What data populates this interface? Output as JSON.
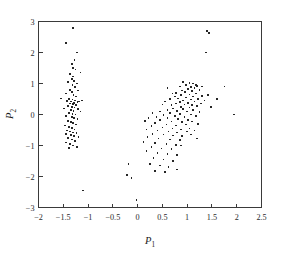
{
  "figure": {
    "background_color": "#ffffff",
    "axis_color": "#3a3a3a",
    "marker_color": "#262626"
  },
  "axes": {
    "x_label": "P",
    "x_label_sub": "1",
    "y_label": "P",
    "y_label_sub": "2"
  },
  "chart_data": {
    "type": "scatter",
    "title": "",
    "xlabel": "P₁",
    "ylabel": "P₂",
    "xlim": [
      -2,
      2.5
    ],
    "ylim": [
      -3,
      3
    ],
    "xticks": [
      -2,
      -1.5,
      -1,
      -0.5,
      0,
      0.5,
      1,
      1.5,
      2,
      2.5
    ],
    "xticklabels": [
      "−2",
      "−1.5",
      "−1",
      "−0.5",
      "0",
      "0.5",
      "1",
      "1.5",
      "2",
      "2.5"
    ],
    "yticks": [
      -3,
      -2,
      -1,
      0,
      1,
      2,
      3
    ],
    "yticklabels": [
      "−3",
      "−2",
      "−1",
      "0",
      "1",
      "2",
      "3"
    ],
    "grid": false,
    "legend": false,
    "marker": "square",
    "marker_size": 1.6,
    "series": [
      {
        "name": "left-cluster",
        "points": [
          [
            -1.3,
            2.8
          ],
          [
            -1.45,
            2.3
          ],
          [
            -1.22,
            2.0
          ],
          [
            -1.27,
            1.75
          ],
          [
            -1.33,
            1.62
          ],
          [
            -1.3,
            1.5
          ],
          [
            -1.25,
            1.45
          ],
          [
            -1.15,
            1.35
          ],
          [
            -1.36,
            1.3
          ],
          [
            -1.3,
            1.22
          ],
          [
            -1.33,
            1.15
          ],
          [
            -1.28,
            1.08
          ],
          [
            -1.4,
            1.05
          ],
          [
            -1.22,
            1.0
          ],
          [
            -1.31,
            0.95
          ],
          [
            -1.26,
            0.88
          ],
          [
            -1.37,
            0.8
          ],
          [
            -1.2,
            0.78
          ],
          [
            -1.33,
            0.72
          ],
          [
            -1.45,
            0.68
          ],
          [
            -1.29,
            0.62
          ],
          [
            -1.24,
            0.58
          ],
          [
            -1.55,
            0.52
          ],
          [
            -1.38,
            0.5
          ],
          [
            -1.31,
            0.48
          ],
          [
            -1.26,
            0.45
          ],
          [
            -1.43,
            0.44
          ],
          [
            -1.34,
            0.42
          ],
          [
            -1.21,
            0.4
          ],
          [
            -1.28,
            0.38
          ],
          [
            -1.18,
            0.42
          ],
          [
            -1.12,
            0.45
          ],
          [
            -1.36,
            0.35
          ],
          [
            -1.3,
            0.33
          ],
          [
            -1.24,
            0.3
          ],
          [
            -1.41,
            0.28
          ],
          [
            -1.33,
            0.25
          ],
          [
            -1.27,
            0.22
          ],
          [
            -1.48,
            0.2
          ],
          [
            -1.2,
            0.18
          ],
          [
            -1.35,
            0.15
          ],
          [
            -1.29,
            0.12
          ],
          [
            -1.15,
            0.1
          ],
          [
            -1.38,
            0.05
          ],
          [
            -1.31,
            0.02
          ],
          [
            -1.25,
            0.0
          ],
          [
            -1.44,
            -0.05
          ],
          [
            -1.33,
            -0.08
          ],
          [
            -1.28,
            -0.12
          ],
          [
            -1.21,
            -0.15
          ],
          [
            -1.4,
            -0.2
          ],
          [
            -1.35,
            -0.25
          ],
          [
            -1.3,
            -0.28
          ],
          [
            -1.24,
            -0.32
          ],
          [
            -1.47,
            -0.35
          ],
          [
            -1.38,
            -0.4
          ],
          [
            -1.32,
            -0.44
          ],
          [
            -1.27,
            -0.48
          ],
          [
            -1.42,
            -0.52
          ],
          [
            -1.36,
            -0.55
          ],
          [
            -1.3,
            -0.58
          ],
          [
            -1.23,
            -0.6
          ],
          [
            -1.45,
            -0.62
          ],
          [
            -1.34,
            -0.66
          ],
          [
            -1.28,
            -0.7
          ],
          [
            -1.19,
            -0.72
          ],
          [
            -1.4,
            -0.75
          ],
          [
            -1.33,
            -0.8
          ],
          [
            -1.26,
            -0.85
          ],
          [
            -1.44,
            -0.9
          ],
          [
            -1.36,
            -0.95
          ],
          [
            -1.3,
            -1.0
          ],
          [
            -1.22,
            -1.05
          ],
          [
            -1.39,
            -1.08
          ],
          [
            -1.1,
            -2.45
          ]
        ]
      },
      {
        "name": "right-cluster",
        "points": [
          [
            1.4,
            2.7
          ],
          [
            1.44,
            2.62
          ],
          [
            1.38,
            2.0
          ],
          [
            0.92,
            1.05
          ],
          [
            1.05,
            1.02
          ],
          [
            1.12,
            1.0
          ],
          [
            0.98,
            0.95
          ],
          [
            1.2,
            0.92
          ],
          [
            1.08,
            0.88
          ],
          [
            0.85,
            0.9
          ],
          [
            1.15,
            0.85
          ],
          [
            1.02,
            0.82
          ],
          [
            0.9,
            0.78
          ],
          [
            1.25,
            0.8
          ],
          [
            1.1,
            0.75
          ],
          [
            0.96,
            0.72
          ],
          [
            0.78,
            0.7
          ],
          [
            1.18,
            0.68
          ],
          [
            1.05,
            0.65
          ],
          [
            0.88,
            0.62
          ],
          [
            1.3,
            0.6
          ],
          [
            1.12,
            0.58
          ],
          [
            0.7,
            0.68
          ],
          [
            0.98,
            0.55
          ],
          [
            0.82,
            0.52
          ],
          [
            1.22,
            0.5
          ],
          [
            1.08,
            0.48
          ],
          [
            0.6,
            0.85
          ],
          [
            0.75,
            0.58
          ],
          [
            0.92,
            0.45
          ],
          [
            1.15,
            0.42
          ],
          [
            0.65,
            0.5
          ],
          [
            0.85,
            0.4
          ],
          [
            1.02,
            0.38
          ],
          [
            1.28,
            0.35
          ],
          [
            0.55,
            0.42
          ],
          [
            0.78,
            0.35
          ],
          [
            0.95,
            0.32
          ],
          [
            1.1,
            0.3
          ],
          [
            1.2,
            0.28
          ],
          [
            0.68,
            0.3
          ],
          [
            0.88,
            0.25
          ],
          [
            1.05,
            0.22
          ],
          [
            0.5,
            0.32
          ],
          [
            0.72,
            0.2
          ],
          [
            0.92,
            0.18
          ],
          [
            1.12,
            0.15
          ],
          [
            0.6,
            0.15
          ],
          [
            0.8,
            0.12
          ],
          [
            1.0,
            0.1
          ],
          [
            1.25,
            0.08
          ],
          [
            0.45,
            0.1
          ],
          [
            0.65,
            0.05
          ],
          [
            0.85,
            0.02
          ],
          [
            1.08,
            0.0
          ],
          [
            0.3,
            0.05
          ],
          [
            0.52,
            -0.02
          ],
          [
            0.75,
            -0.05
          ],
          [
            0.95,
            -0.08
          ],
          [
            1.18,
            -0.05
          ],
          [
            0.38,
            -0.08
          ],
          [
            0.6,
            -0.12
          ],
          [
            0.82,
            -0.15
          ],
          [
            1.02,
            -0.18
          ],
          [
            0.22,
            -0.12
          ],
          [
            0.45,
            -0.18
          ],
          [
            0.68,
            -0.22
          ],
          [
            0.9,
            -0.25
          ],
          [
            1.1,
            -0.22
          ],
          [
            0.15,
            -0.2
          ],
          [
            0.35,
            -0.28
          ],
          [
            0.58,
            -0.32
          ],
          [
            0.78,
            -0.35
          ],
          [
            0.98,
            -0.32
          ],
          [
            1.22,
            -0.3
          ],
          [
            0.28,
            -0.38
          ],
          [
            0.5,
            -0.42
          ],
          [
            0.7,
            -0.45
          ],
          [
            0.88,
            -0.48
          ],
          [
            1.05,
            -0.45
          ],
          [
            0.18,
            -0.48
          ],
          [
            0.4,
            -0.52
          ],
          [
            0.62,
            -0.55
          ],
          [
            0.8,
            -0.58
          ],
          [
            1.0,
            -0.55
          ],
          [
            1.15,
            -0.52
          ],
          [
            0.3,
            -0.62
          ],
          [
            0.52,
            -0.65
          ],
          [
            0.72,
            -0.68
          ],
          [
            0.9,
            -0.7
          ],
          [
            1.08,
            -0.65
          ],
          [
            0.2,
            -0.72
          ],
          [
            0.42,
            -0.78
          ],
          [
            0.65,
            -0.8
          ],
          [
            0.85,
            -0.82
          ],
          [
            1.2,
            -0.78
          ],
          [
            0.12,
            -0.88
          ],
          [
            0.35,
            -0.92
          ],
          [
            0.58,
            -0.95
          ],
          [
            0.78,
            -0.98
          ],
          [
            0.28,
            -1.05
          ],
          [
            0.48,
            -1.1
          ],
          [
            0.68,
            -1.12
          ],
          [
            0.88,
            -1.0
          ],
          [
            0.18,
            -1.18
          ],
          [
            0.4,
            -1.25
          ],
          [
            0.6,
            -1.28
          ],
          [
            0.8,
            -1.3
          ],
          [
            0.32,
            -1.4
          ],
          [
            0.52,
            -1.45
          ],
          [
            0.72,
            -1.5
          ],
          [
            0.25,
            -1.6
          ],
          [
            0.45,
            -1.65
          ],
          [
            0.62,
            -1.7
          ],
          [
            0.8,
            -1.78
          ],
          [
            0.35,
            -1.82
          ],
          [
            0.55,
            -1.85
          ],
          [
            -0.18,
            -1.6
          ],
          [
            -0.22,
            -1.95
          ],
          [
            -0.12,
            -2.05
          ],
          [
            -0.02,
            -2.75
          ],
          [
            1.6,
            0.5
          ],
          [
            1.75,
            0.9
          ],
          [
            1.95,
            0.0
          ],
          [
            1.42,
            0.62
          ],
          [
            1.35,
            0.45
          ],
          [
            1.48,
            0.25
          ],
          [
            1.3,
            0.9
          ],
          [
            1.18,
            0.95
          ]
        ]
      }
    ]
  }
}
